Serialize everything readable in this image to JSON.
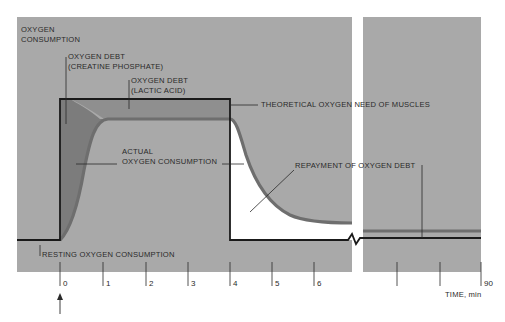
{
  "diagram": {
    "y_axis_label_line1": "OXYGEN",
    "y_axis_label_line2": "CONSUMPTION",
    "x_axis_label": "TIME, min",
    "labels": {
      "creatine_line1": "OXYGEN DEBT",
      "creatine_line2": "(CREATINE PHOSPHATE)",
      "lactic_line1": "OXYGEN DEBT",
      "lactic_line2": "(LACTIC ACID)",
      "theoretical": "THEORETICAL OXYGEN NEED OF MUSCLES",
      "actual_line1": "ACTUAL",
      "actual_line2": "OXYGEN CONSUMPTION",
      "repayment": "REPAYMENT OF OXYGEN DEBT",
      "resting": "RESTING OXYGEN CONSUMPTION"
    },
    "ticks": [
      "0",
      "1",
      "2",
      "3",
      "4",
      "5",
      "6",
      "90"
    ],
    "colors": {
      "background_panel": "#a9a9a9",
      "debt_creatine": "#7c7c7c",
      "debt_lactic": "#8f8f8f",
      "actual_curve": "#6e6e6e",
      "repayment_area": "#ffffff",
      "line": "#1a1a1a"
    },
    "start_marker": "arrow-up at time 0"
  }
}
